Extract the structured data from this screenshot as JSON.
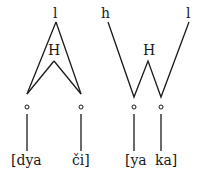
{
  "left_diagram": {
    "top_tone": "l",
    "mid_tone": "H",
    "syllables": [
      "[dya",
      "či]"
    ]
  },
  "right_diagram": {
    "left_tone": "h",
    "right_tone": "l",
    "mid_tone": "H",
    "syllables": [
      "[ya",
      "ka]"
    ]
  },
  "colors": {
    "ink": "#1a1a1a",
    "background": "#ffffff"
  }
}
